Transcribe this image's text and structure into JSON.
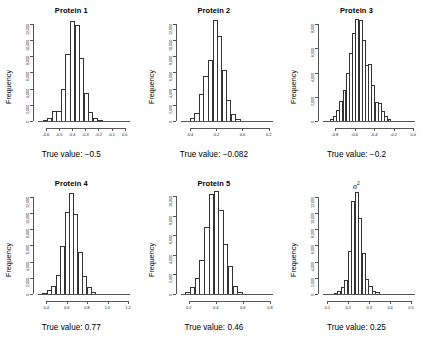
{
  "figure": {
    "width": 428,
    "height": 346,
    "background": "#ffffff",
    "rows": 2,
    "cols": 3,
    "shared_ylabel": "Frequency",
    "bar_outline_color": "#333333",
    "axis_color": "#555555"
  },
  "chart_data": [
    {
      "type": "bar",
      "title": "Protein 1",
      "subtitle": "",
      "xlabel": "True value: −0.5",
      "ylabel": "Frequency",
      "true_value": -0.5,
      "xlim": [
        -0.66,
        0.04
      ],
      "ylim": [
        0,
        12800
      ],
      "xticks": [
        "-0.6",
        "-0.5",
        "-0.4",
        "-0.3",
        "-0.2",
        "-0.1",
        "0.0"
      ],
      "xtick_values": [
        -0.6,
        -0.5,
        -0.4,
        -0.3,
        -0.2,
        -0.1,
        0.0
      ],
      "yticks": [
        "0",
        "2,000",
        "4,000",
        "6,000",
        "8,000",
        "10,000",
        "12,000"
      ],
      "ytick_values": [
        0,
        2000,
        4000,
        6000,
        8000,
        10000,
        12000
      ],
      "bin_edges": [
        -0.66,
        -0.62,
        -0.58,
        -0.54,
        -0.5,
        -0.46,
        -0.42,
        -0.38,
        -0.34,
        -0.3,
        -0.26,
        -0.22,
        -0.18,
        -0.14,
        -0.1,
        -0.06,
        -0.02
      ],
      "values": [
        30,
        120,
        400,
        1200,
        1250,
        3900,
        8300,
        12300,
        11800,
        7700,
        3400,
        1100,
        380,
        120,
        40,
        10
      ],
      "grid": false,
      "legend": null
    },
    {
      "type": "bar",
      "title": "Protein 2",
      "subtitle": "",
      "xlabel": "True value: −0.082",
      "ylabel": "Frequency",
      "true_value": -0.082,
      "xlim": [
        -0.47,
        0.23
      ],
      "ylim": [
        0,
        12800
      ],
      "xticks": [
        "-0.4",
        "-0.2",
        "0.0",
        "0.2"
      ],
      "xtick_values": [
        -0.4,
        -0.2,
        0.0,
        0.2
      ],
      "yticks": [
        "0",
        "2,000",
        "4,000",
        "6,000",
        "8,000",
        "10,000",
        "12,000"
      ],
      "ytick_values": [
        0,
        2000,
        4000,
        6000,
        8000,
        10000,
        12000
      ],
      "bin_edges": [
        -0.47,
        -0.43,
        -0.39,
        -0.35,
        -0.31,
        -0.27,
        -0.23,
        -0.19,
        -0.15,
        -0.11,
        -0.07,
        -0.03,
        0.01,
        0.05,
        0.09,
        0.13,
        0.17
      ],
      "values": [
        20,
        90,
        330,
        1000,
        3300,
        5600,
        7500,
        12400,
        10500,
        6300,
        2600,
        850,
        250,
        80,
        25,
        8
      ],
      "grid": false,
      "legend": null
    },
    {
      "type": "bar",
      "title": "Protein 3",
      "subtitle": "",
      "xlabel": "True value: −0.2",
      "ylabel": "Frequency",
      "true_value": -0.2,
      "xlim": [
        -0.92,
        0.02
      ],
      "ylim": [
        0,
        8600
      ],
      "xticks": [
        "-0.8",
        "-0.6",
        "-0.4",
        "-0.2",
        "0.0"
      ],
      "xtick_values": [
        -0.8,
        -0.6,
        -0.4,
        -0.2,
        0.0
      ],
      "yticks": [
        "0",
        "2,000",
        "4,000",
        "6,000",
        "8,000"
      ],
      "ytick_values": [
        0,
        2000,
        4000,
        6000,
        8000
      ],
      "bin_edges": [
        -0.92,
        -0.88,
        -0.84,
        -0.8,
        -0.76,
        -0.72,
        -0.68,
        -0.64,
        -0.6,
        -0.56,
        -0.52,
        -0.48,
        -0.44,
        -0.4,
        -0.36,
        -0.32,
        -0.28,
        -0.24,
        -0.2,
        -0.16,
        -0.12,
        -0.08,
        -0.04
      ],
      "values": [
        15,
        60,
        180,
        420,
        900,
        1650,
        2600,
        4000,
        5600,
        7300,
        8450,
        8350,
        6700,
        4600,
        4700,
        3000,
        1600,
        1500,
        800,
        380,
        150,
        50
      ],
      "grid": false,
      "legend": null
    },
    {
      "type": "bar",
      "title": "Protein 4",
      "subtitle": "",
      "xlabel": "True value: 0.77",
      "ylabel": "Frequency",
      "true_value": 0.77,
      "xlim": [
        0.32,
        1.22
      ],
      "ylim": [
        0,
        12800
      ],
      "xticks": [
        "0.4",
        "0.6",
        "0.8",
        "1.0",
        "1.2"
      ],
      "xtick_values": [
        0.4,
        0.6,
        0.8,
        1.0,
        1.2
      ],
      "yticks": [
        "0",
        "2,000",
        "4,000",
        "6,000",
        "8,000",
        "10,000",
        "12,000"
      ],
      "ytick_values": [
        0,
        2000,
        4000,
        6000,
        8000,
        10000,
        12000
      ],
      "bin_edges": [
        0.32,
        0.37,
        0.42,
        0.47,
        0.52,
        0.57,
        0.62,
        0.67,
        0.72,
        0.77,
        0.82,
        0.87,
        0.92,
        0.97,
        1.02,
        1.07,
        1.12
      ],
      "values": [
        40,
        150,
        500,
        1000,
        2400,
        5900,
        10100,
        12400,
        9900,
        5200,
        2200,
        900,
        250,
        70,
        20,
        5
      ],
      "grid": false,
      "legend": null
    },
    {
      "type": "bar",
      "title": "Protein 5",
      "subtitle": "",
      "xlabel": "True value: 0.46",
      "ylabel": "Frequency",
      "true_value": 0.46,
      "xlim": [
        0.14,
        0.82
      ],
      "ylim": [
        0,
        10600
      ],
      "xticks": [
        "0.2",
        "0.4",
        "0.6",
        "0.8"
      ],
      "xtick_values": [
        0.2,
        0.4,
        0.6,
        0.8
      ],
      "yticks": [
        "0",
        "2,000",
        "4,000",
        "6,000",
        "8,000",
        "10,000"
      ],
      "ytick_values": [
        0,
        2000,
        4000,
        6000,
        8000,
        10000
      ],
      "bin_edges": [
        0.14,
        0.18,
        0.22,
        0.26,
        0.3,
        0.34,
        0.38,
        0.42,
        0.46,
        0.5,
        0.54,
        0.58,
        0.62,
        0.66,
        0.7,
        0.74,
        0.78
      ],
      "values": [
        60,
        200,
        700,
        1600,
        3500,
        6800,
        10200,
        10450,
        8600,
        5100,
        2900,
        800,
        250,
        70,
        20,
        6
      ],
      "grid": false,
      "legend": null
    },
    {
      "type": "bar",
      "title": "σ²",
      "subtitle": "",
      "xlabel": "True value: 0.25",
      "ylabel": "Frequency",
      "true_value": 0.25,
      "xlim": [
        0.08,
        0.52
      ],
      "ylim": [
        0,
        12800
      ],
      "xticks": [
        "0.1",
        "0.2",
        "0.3",
        "0.4",
        "0.5"
      ],
      "xtick_values": [
        0.1,
        0.2,
        0.3,
        0.4,
        0.5
      ],
      "yticks": [
        "0",
        "2,000",
        "4,000",
        "6,000",
        "8,000",
        "10,000",
        "12,000"
      ],
      "ytick_values": [
        0,
        2000,
        4000,
        6000,
        8000,
        10000,
        12000
      ],
      "bin_edges": [
        0.08,
        0.1,
        0.12,
        0.14,
        0.16,
        0.18,
        0.2,
        0.22,
        0.24,
        0.26,
        0.28,
        0.3,
        0.32,
        0.34,
        0.36,
        0.38,
        0.4,
        0.42,
        0.44,
        0.46,
        0.48,
        0.5
      ],
      "values": [
        10,
        25,
        60,
        160,
        350,
        900,
        1700,
        5300,
        11400,
        12600,
        9300,
        5000,
        1900,
        1000,
        320,
        300,
        90,
        30,
        10,
        5,
        2
      ],
      "grid": false,
      "legend": null
    }
  ]
}
